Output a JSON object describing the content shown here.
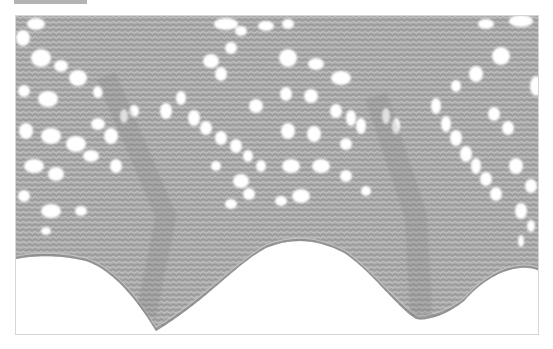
{
  "image": {
    "subject": "knitted lace edging with scalloped border",
    "description": "Gray mohair-like lace knitting with diagonal eyelet rows converging into chevrons and two pointed scallops along the bottom edge",
    "colors": {
      "yarn": "#a9a9a9",
      "yarn_dark": "#8f8f8f",
      "yarn_light": "#c4c4c4",
      "background": "#ffffff",
      "frame_border": "#d6d6d6",
      "top_tab": "#b3b3b3"
    }
  },
  "header": {
    "tab_label": "",
    "caption": ""
  }
}
